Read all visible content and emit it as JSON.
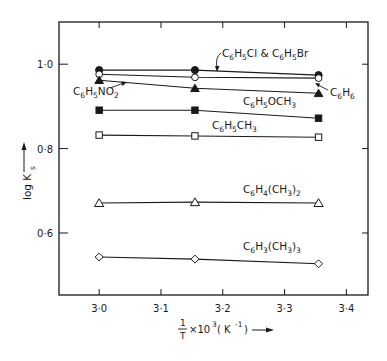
{
  "chart_data": {
    "type": "line",
    "title": "",
    "xlabel": "1/T ×10^3 (K^-1)",
    "ylabel": "log K_s",
    "xlim": [
      2.935,
      3.435
    ],
    "ylim": [
      0.453,
      1.1
    ],
    "x_ticks": [
      3.0,
      3.1,
      3.2,
      3.3,
      3.4
    ],
    "x_tick_labels": [
      "3·0",
      "3·1",
      "3·2",
      "3·3",
      "3·4"
    ],
    "y_ticks": [
      0.6,
      0.8,
      1.0
    ],
    "y_tick_labels": [
      "0·6",
      "0·8",
      "1·0"
    ],
    "grid": false,
    "legend": "inline labels",
    "x": [
      3.0,
      3.155,
      3.355
    ],
    "series": [
      {
        "name": "C6H5Cl",
        "marker": "filled-circle",
        "values": [
          0.986,
          0.986,
          0.974
        ]
      },
      {
        "name": "C6H5Br",
        "marker": "open-circle",
        "values": [
          0.976,
          0.969,
          0.967
        ]
      },
      {
        "name": "C6H6 / C6H5NO2",
        "marker": "filled-triangle",
        "values": [
          0.962,
          0.943,
          0.931
        ]
      },
      {
        "name": "C6H5OCH3",
        "marker": "filled-square",
        "values": [
          0.891,
          0.891,
          0.872
        ]
      },
      {
        "name": "C6H5CH3",
        "marker": "open-square",
        "values": [
          0.832,
          0.83,
          0.827
        ]
      },
      {
        "name": "C6H4(CH3)2",
        "marker": "open-triangle",
        "values": [
          0.671,
          0.673,
          0.671
        ]
      },
      {
        "name": "C6H3(CH3)3",
        "marker": "open-diamond",
        "values": [
          0.543,
          0.538,
          0.527
        ]
      }
    ],
    "annotations": [
      {
        "text": "C6H5Cl & C6H5Br"
      },
      {
        "text": "C6H5NO2"
      },
      {
        "text": "C6H6"
      },
      {
        "text": "C6H5OCH3"
      },
      {
        "text": "C6H5CH3"
      },
      {
        "text": "C6H4(CH3)2"
      },
      {
        "text": "C6H3(CH3)3"
      }
    ]
  },
  "labels": {
    "ylabel_main": "log K",
    "ylabel_sub": "s",
    "xlabel_frac_num": "1",
    "xlabel_frac_den": "T",
    "xlabel_rest": "×10",
    "xlabel_exp": "3",
    "xlabel_unit_open": " ( K",
    "xlabel_unit_exp": "-1",
    "xlabel_unit_close": ")"
  }
}
